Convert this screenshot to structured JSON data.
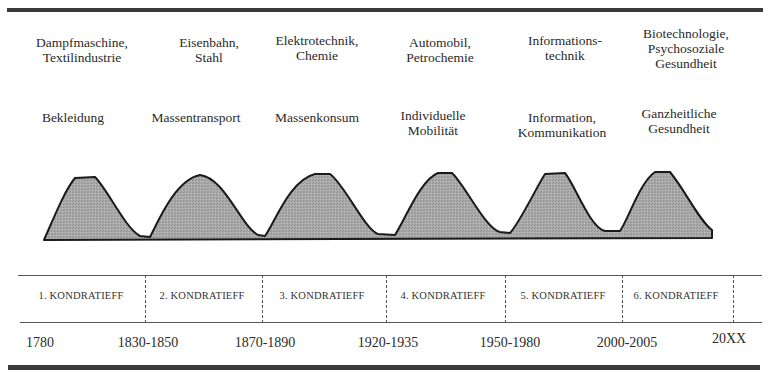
{
  "diagram": {
    "cycles": [
      {
        "number": 1,
        "label": "1. KONDRATIEFF",
        "technology": "Dampfmaschine,\nTextilindustrie",
        "need": "Bekleidung",
        "start_year": "1780"
      },
      {
        "number": 2,
        "label": "2. KONDRATIEFF",
        "technology": "Eisenbahn,\nStahl",
        "need": "Massentransport",
        "start_year": "1830-1850"
      },
      {
        "number": 3,
        "label": "3. KONDRATIEFF",
        "technology": "Elektrotechnik,\nChemie",
        "need": "Massenkonsum",
        "start_year": "1870-1890"
      },
      {
        "number": 4,
        "label": "4. KONDRATIEFF",
        "technology": "Automobil,\nPetrochemie",
        "need": "Individuelle\nMobilität",
        "start_year": "1920-1935"
      },
      {
        "number": 5,
        "label": "5. KONDRATIEFF",
        "technology": "Informations-\ntechnik",
        "need": "Information,\nKommunikation",
        "start_year": "1950-1980"
      },
      {
        "number": 6,
        "label": "6. KONDRATIEFF",
        "technology": "Biotechnologie,\nPsychosoziale\nGesundheit",
        "need": "Ganzheitliche\nGesundheit",
        "start_year": "2000-2005"
      }
    ],
    "end_year": "20XX",
    "colors": {
      "wave_fill": "#a8a8a8",
      "wave_stroke": "#1a1a1a",
      "rule": "#3a3a3a",
      "text": "#2a2a2a"
    }
  }
}
